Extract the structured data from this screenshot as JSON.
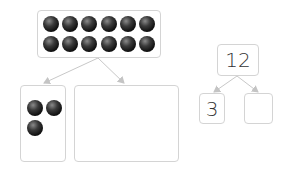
{
  "header": {
    "cutoff_text": "— — — — — ·   · · · ·"
  },
  "left_diagram": {
    "whole_box": {
      "ball_count": 12,
      "rows": 2,
      "per_row": 6
    },
    "part_left": {
      "ball_count": 3
    },
    "part_right": {
      "ball_count": 0
    }
  },
  "number_bond": {
    "whole": "12",
    "part_left": "3",
    "part_right": ""
  },
  "colors": {
    "border": "#d4d4d4",
    "arrow": "#c0c0c0",
    "ball": "#1a1a1a",
    "text": "#333333"
  }
}
